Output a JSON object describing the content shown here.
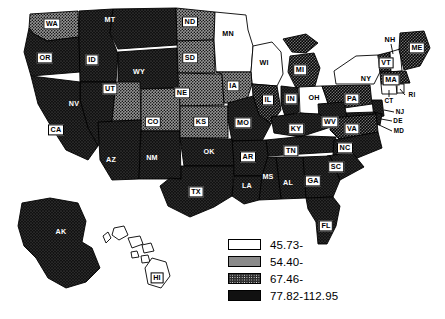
{
  "figure": {
    "title": "",
    "background": "#ffffff"
  },
  "chart_data": {
    "type": "choropleth-map",
    "title": "",
    "subtitle": "",
    "region": "United States",
    "projection": "composite (contiguous + AK + HI insets)",
    "grid": false,
    "legend": {
      "position": "bottom-right",
      "title": "",
      "entries": [
        {
          "swatch": "white",
          "label": "45.73-",
          "class_index": 0,
          "range_min": 45.73,
          "range_max": 54.4
        },
        {
          "swatch": "light-stipple",
          "label": "54.40-",
          "class_index": 1,
          "range_min": 54.4,
          "range_max": 67.46
        },
        {
          "swatch": "dark-stipple",
          "label": "67.46-",
          "class_index": 2,
          "range_min": 67.46,
          "range_max": 77.82
        },
        {
          "swatch": "solid-black",
          "label": "77.82-112.95",
          "class_index": 3,
          "range_min": 77.82,
          "range_max": 112.95
        }
      ]
    },
    "value_range": [
      45.73,
      112.95
    ],
    "class_count": 4,
    "states": [
      {
        "code": "WA",
        "class_index": 1
      },
      {
        "code": "OR",
        "class_index": 3
      },
      {
        "code": "ID",
        "class_index": 3
      },
      {
        "code": "MT",
        "class_index": 3
      },
      {
        "code": "WY",
        "class_index": 3
      },
      {
        "code": "ND",
        "class_index": 1
      },
      {
        "code": "SD",
        "class_index": 1
      },
      {
        "code": "MN",
        "class_index": 0
      },
      {
        "code": "WI",
        "class_index": 0
      },
      {
        "code": "NV",
        "class_index": 3
      },
      {
        "code": "UT",
        "class_index": 1
      },
      {
        "code": "CO",
        "class_index": 1
      },
      {
        "code": "NE",
        "class_index": 1
      },
      {
        "code": "IA",
        "class_index": 1
      },
      {
        "code": "IL",
        "class_index": 2
      },
      {
        "code": "MI",
        "class_index": 2
      },
      {
        "code": "CA",
        "class_index": 3
      },
      {
        "code": "AZ",
        "class_index": 3
      },
      {
        "code": "NM",
        "class_index": 3
      },
      {
        "code": "KS",
        "class_index": 1
      },
      {
        "code": "MO",
        "class_index": 3
      },
      {
        "code": "IN",
        "class_index": 3
      },
      {
        "code": "OH",
        "class_index": 0
      },
      {
        "code": "PA",
        "class_index": 2
      },
      {
        "code": "NY",
        "class_index": 0
      },
      {
        "code": "VT",
        "class_index": 2
      },
      {
        "code": "NH",
        "class_index": 0
      },
      {
        "code": "ME",
        "class_index": 2
      },
      {
        "code": "MA",
        "class_index": 2
      },
      {
        "code": "CT",
        "class_index": 0
      },
      {
        "code": "RI",
        "class_index": 0
      },
      {
        "code": "NJ",
        "class_index": 3
      },
      {
        "code": "DE",
        "class_index": 3
      },
      {
        "code": "MD",
        "class_index": 3
      },
      {
        "code": "WV",
        "class_index": 3
      },
      {
        "code": "VA",
        "class_index": 2
      },
      {
        "code": "KY",
        "class_index": 3
      },
      {
        "code": "TN",
        "class_index": 3
      },
      {
        "code": "NC",
        "class_index": 3
      },
      {
        "code": "SC",
        "class_index": 3
      },
      {
        "code": "GA",
        "class_index": 3
      },
      {
        "code": "AL",
        "class_index": 3
      },
      {
        "code": "MS",
        "class_index": 3
      },
      {
        "code": "AR",
        "class_index": 3
      },
      {
        "code": "LA",
        "class_index": 3
      },
      {
        "code": "OK",
        "class_index": 3
      },
      {
        "code": "TX",
        "class_index": 3
      },
      {
        "code": "FL",
        "class_index": 3
      },
      {
        "code": "AK",
        "class_index": 3
      },
      {
        "code": "HI",
        "class_index": 0
      }
    ]
  },
  "labels": [
    {
      "code": "WA",
      "x": 52,
      "y": 24,
      "style": "box"
    },
    {
      "code": "MT",
      "x": 110,
      "y": 20,
      "style": "plainw"
    },
    {
      "code": "ND",
      "x": 190,
      "y": 22,
      "style": "box"
    },
    {
      "code": "MN",
      "x": 228,
      "y": 34,
      "style": "plaink"
    },
    {
      "code": "OR",
      "x": 45,
      "y": 58,
      "style": "box"
    },
    {
      "code": "ID",
      "x": 92,
      "y": 60,
      "style": "box"
    },
    {
      "code": "WY",
      "x": 139,
      "y": 72,
      "style": "plainw"
    },
    {
      "code": "SD",
      "x": 190,
      "y": 58,
      "style": "box"
    },
    {
      "code": "WI",
      "x": 264,
      "y": 63,
      "style": "plaink"
    },
    {
      "code": "MI",
      "x": 300,
      "y": 70,
      "style": "box"
    },
    {
      "code": "NH",
      "x": 390,
      "y": 40,
      "style": "plaink"
    },
    {
      "code": "ME",
      "x": 417,
      "y": 48,
      "style": "box"
    },
    {
      "code": "VT",
      "x": 386,
      "y": 63,
      "style": "box"
    },
    {
      "code": "NY",
      "x": 366,
      "y": 79,
      "style": "plaink"
    },
    {
      "code": "NV",
      "x": 74,
      "y": 104,
      "style": "plainw"
    },
    {
      "code": "UT",
      "x": 110,
      "y": 89,
      "style": "box"
    },
    {
      "code": "NE",
      "x": 182,
      "y": 93,
      "style": "box"
    },
    {
      "code": "IA",
      "x": 233,
      "y": 86,
      "style": "box"
    },
    {
      "code": "IL",
      "x": 268,
      "y": 100,
      "style": "box"
    },
    {
      "code": "IN",
      "x": 291,
      "y": 99,
      "style": "box"
    },
    {
      "code": "OH",
      "x": 314,
      "y": 98,
      "style": "plaink"
    },
    {
      "code": "PA",
      "x": 352,
      "y": 99,
      "style": "box"
    },
    {
      "code": "MA",
      "x": 391,
      "y": 80,
      "style": "box"
    },
    {
      "code": "CT",
      "x": 389,
      "y": 101,
      "style": "small-plaink"
    },
    {
      "code": "RI",
      "x": 412,
      "y": 95,
      "style": "small-plaink"
    },
    {
      "code": "NJ",
      "x": 400,
      "y": 112,
      "style": "small-plaink"
    },
    {
      "code": "DE",
      "x": 398,
      "y": 121,
      "style": "small-plaink"
    },
    {
      "code": "MD",
      "x": 399,
      "y": 131,
      "style": "small-plaink"
    },
    {
      "code": "CO",
      "x": 153,
      "y": 122,
      "style": "box"
    },
    {
      "code": "KS",
      "x": 201,
      "y": 122,
      "style": "box"
    },
    {
      "code": "MO",
      "x": 243,
      "y": 123,
      "style": "box"
    },
    {
      "code": "KY",
      "x": 296,
      "y": 129,
      "style": "box"
    },
    {
      "code": "WV",
      "x": 330,
      "y": 122,
      "style": "box"
    },
    {
      "code": "VA",
      "x": 352,
      "y": 129,
      "style": "box"
    },
    {
      "code": "CA",
      "x": 56,
      "y": 130,
      "style": "box"
    },
    {
      "code": "AZ",
      "x": 111,
      "y": 160,
      "style": "plainw"
    },
    {
      "code": "NM",
      "x": 152,
      "y": 158,
      "style": "plainw"
    },
    {
      "code": "OK",
      "x": 209,
      "y": 152,
      "style": "plainw"
    },
    {
      "code": "AR",
      "x": 248,
      "y": 157,
      "style": "box"
    },
    {
      "code": "TN",
      "x": 291,
      "y": 151,
      "style": "box"
    },
    {
      "code": "NC",
      "x": 345,
      "y": 148,
      "style": "box"
    },
    {
      "code": "SC",
      "x": 336,
      "y": 167,
      "style": "box"
    },
    {
      "code": "MS",
      "x": 268,
      "y": 177,
      "style": "plainw"
    },
    {
      "code": "AL",
      "x": 288,
      "y": 183,
      "style": "plainw"
    },
    {
      "code": "GA",
      "x": 313,
      "y": 181,
      "style": "box"
    },
    {
      "code": "LA",
      "x": 247,
      "y": 186,
      "style": "plainw"
    },
    {
      "code": "TX",
      "x": 196,
      "y": 192,
      "style": "box"
    },
    {
      "code": "FL",
      "x": 326,
      "y": 226,
      "style": "box"
    },
    {
      "code": "AK",
      "x": 61,
      "y": 232,
      "style": "plainw"
    },
    {
      "code": "HI",
      "x": 157,
      "y": 278,
      "style": "box"
    }
  ]
}
